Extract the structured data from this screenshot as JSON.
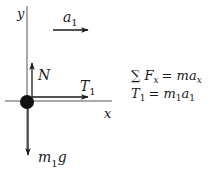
{
  "diagram": {
    "axes": {
      "x_label": "x",
      "y_label": "y"
    },
    "vectors": {
      "acceleration": {
        "label": "a",
        "sub": "1",
        "direction": "right"
      },
      "normal": {
        "label": "N",
        "direction": "up"
      },
      "tension": {
        "label": "T",
        "sub": "1",
        "direction": "right"
      },
      "weight": {
        "label_m": "m",
        "sub": "1",
        "label_g": "g",
        "direction": "down"
      }
    },
    "equations": {
      "line1": {
        "sum": "∑",
        "F": "F",
        "F_sub": "x",
        "eq": "=",
        "m": "m",
        "a": "a",
        "a_sub": "x"
      },
      "line2": {
        "T": "T",
        "T_sub": "1",
        "eq": "=",
        "m": "m",
        "m_sub": "1",
        "a": "a",
        "a_sub": "1"
      }
    },
    "colors": {
      "ink": "#1a1a1a",
      "axis": "#555555",
      "background": "#ffffff"
    }
  }
}
